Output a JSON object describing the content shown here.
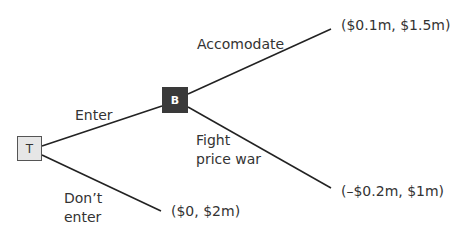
{
  "nodes": {
    "t": {
      "label": "T",
      "fill": "#e6e6e6"
    },
    "b": {
      "label": "B",
      "fill": "#3a3a3a"
    }
  },
  "edges": {
    "enter": {
      "label": "Enter"
    },
    "dont_enter": {
      "label_line1": "Don’t",
      "label_line2": "enter"
    },
    "accomodate": {
      "label": "Accomodate"
    },
    "fight": {
      "label_line1": "Fight",
      "label_line2": "price war"
    }
  },
  "payoffs": {
    "accomodate": "($0.1m, $1.5m)",
    "fight": "(–$0.2m, $1m)",
    "dont_enter": "($0, $2m)"
  }
}
